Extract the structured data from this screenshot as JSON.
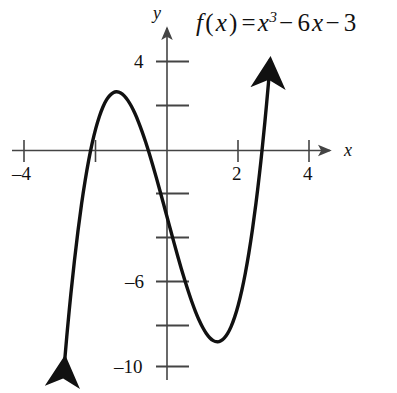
{
  "chart_data": {
    "type": "line",
    "title": "",
    "function_label": "f(x) = x³ − 6x − 3",
    "formula_parts": {
      "fn_name": "f",
      "open_paren": "(",
      "variable": "x",
      "close_paren": ")",
      "equals": "=",
      "base": "x",
      "exponent": "3",
      "minus_1": "−",
      "coef": "6",
      "var2": "x",
      "minus_2": "−",
      "constant": "3"
    },
    "xlabel": "x",
    "ylabel": "y",
    "xlim": [
      -4.6,
      4.7
    ],
    "ylim": [
      -10.9,
      5.5
    ],
    "grid": false,
    "legend": "none",
    "x_ticks": [
      -4,
      -2,
      2,
      4
    ],
    "x_tick_labels": [
      "–4",
      "",
      "2",
      "4"
    ],
    "y_ticks": [
      4,
      2,
      -2,
      -4,
      -6,
      -8,
      -10
    ],
    "y_tick_labels": [
      "4",
      "",
      "",
      "",
      "–6",
      "",
      "–10"
    ],
    "curve_color": "#111111",
    "axis_color": "#444444",
    "x": [
      -2.87,
      -2.8,
      -2.7,
      -2.6,
      -2.5,
      -2.4,
      -2.3,
      -2.2,
      -2.1,
      -2.0,
      -1.9,
      -1.8,
      -1.7,
      -1.6,
      -1.5,
      -1.4142,
      -1.3,
      -1.2,
      -1.1,
      -1.0,
      -0.9,
      -0.8,
      -0.7,
      -0.6,
      -0.5,
      -0.4,
      -0.3,
      -0.2,
      -0.1,
      0.0,
      0.1,
      0.2,
      0.3,
      0.4,
      0.5,
      0.6,
      0.7,
      0.8,
      0.9,
      1.0,
      1.1,
      1.2,
      1.3,
      1.4142,
      1.5,
      1.6,
      1.7,
      1.8,
      1.9,
      2.0,
      2.1,
      2.2,
      2.3,
      2.4,
      2.5,
      2.6,
      2.67,
      2.75,
      2.85,
      2.9
    ],
    "y": [
      -9.43,
      -8.15,
      -6.48,
      -4.98,
      -3.63,
      -2.42,
      -1.37,
      -0.45,
      0.34,
      1.0,
      1.54,
      1.97,
      2.29,
      2.5,
      2.63,
      2.657,
      2.603,
      2.472,
      2.269,
      2.0,
      1.671,
      1.288,
      0.857,
      0.384,
      -0.125,
      -0.664,
      -1.227,
      -1.808,
      -2.401,
      -3.0,
      -3.599,
      -4.192,
      -4.773,
      -5.336,
      -5.875,
      -6.384,
      -6.857,
      -7.288,
      -7.671,
      -8.0,
      -8.269,
      -8.472,
      -8.603,
      -8.657,
      -8.625,
      -8.504,
      -8.287,
      -7.968,
      -7.541,
      -7.0,
      -6.339,
      -5.552,
      -4.633,
      -3.576,
      -2.375,
      -1.024,
      0.015,
      1.3,
      3.05,
      4.09
    ],
    "annotations": [
      {
        "name": "local-max",
        "x": -1.4142,
        "y": 2.657
      },
      {
        "name": "local-min",
        "x": 1.4142,
        "y": -8.657
      },
      {
        "name": "y-intercept",
        "x": 0,
        "y": -3
      }
    ],
    "arrows": [
      {
        "name": "curve-arrow-down-left",
        "at_x": -2.87,
        "at_y": -10.4
      },
      {
        "name": "curve-arrow-up-right",
        "at_x": 2.9,
        "at_y": 4.45
      },
      {
        "name": "x-axis-arrow",
        "direction": "right"
      },
      {
        "name": "y-axis-arrow",
        "direction": "up"
      }
    ]
  },
  "axis_labels": {
    "x": "x",
    "y": "y"
  },
  "tick_text": {
    "x_neg4": "–4",
    "x_2": "2",
    "x_4": "4",
    "y_4": "4",
    "y_neg6": "–6",
    "y_neg10": "–10"
  }
}
